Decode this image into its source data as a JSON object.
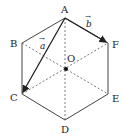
{
  "figure": {
    "line_color": "#333333",
    "vertices": {
      "A": {
        "label": "A",
        "x": 65,
        "y": 18
      },
      "B": {
        "label": "B",
        "x": 22,
        "y": 43
      },
      "C": {
        "label": "C",
        "x": 22,
        "y": 94
      },
      "D": {
        "label": "D",
        "x": 65,
        "y": 120
      },
      "E": {
        "label": "E",
        "x": 108,
        "y": 94
      },
      "F": {
        "label": "F",
        "x": 108,
        "y": 43
      }
    },
    "center": {
      "label": "O",
      "x": 66,
      "y": 69
    },
    "vectors": [
      {
        "name": "a",
        "label": "a",
        "arrow": "→",
        "from": "A",
        "to": "C"
      },
      {
        "name": "b",
        "label": "b",
        "arrow": "→",
        "from": "A",
        "to": "F"
      }
    ],
    "dashed_diagonals": [
      "A-D",
      "B-E",
      "C-F"
    ]
  }
}
